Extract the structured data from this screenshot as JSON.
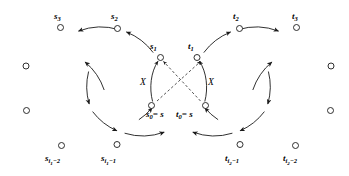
{
  "figure": {
    "name": "two-cycle-crossing-diagram",
    "background": "#ffffff",
    "stroke_color": "#1a1a1a",
    "node_fill": "#ffffff",
    "width": 349,
    "height": 176
  },
  "labels": {
    "s3": "s",
    "s3_sub": "3",
    "s2": "s",
    "s2_sub": "2",
    "s1": "s",
    "s1_sub": "1",
    "s0": "s",
    "s0_sub": "0",
    "s0_eq": "= s",
    "si1m1": "s",
    "si1m1_sub": "i",
    "si1m1_sub2": "1",
    "si1m1_tail": "−1",
    "si1m2": "s",
    "si1m2_sub": "i",
    "si1m2_sub2": "1",
    "si1m2_tail": "−2",
    "t3": "t",
    "t3_sub": "3",
    "t2": "t",
    "t2_sub": "2",
    "t1": "t",
    "t1_sub": "1",
    "t0": "t",
    "t0_sub": "0",
    "t0_eq": "= s",
    "ti2m1": "t",
    "ti2m1_sub": "i",
    "ti2m1_sub2": "2",
    "ti2m1_tail": "−1",
    "ti2m2": "t",
    "ti2m2_sub": "i",
    "ti2m2_sub2": "2",
    "ti2m2_tail": "−2",
    "x_left": "X",
    "x_right": "X"
  },
  "graph_structure": {
    "left_cycle": {
      "name": "s-cycle",
      "direction": "counterclockwise",
      "center": [
        150,
        88
      ],
      "radius": 62,
      "labeled_nodes": [
        "s1",
        "s2",
        "s3",
        "s_{i1-2}",
        "s_{i1-1}",
        "s0"
      ],
      "unlabeled_node_count": 2
    },
    "right_cycle": {
      "name": "t-cycle",
      "direction": "clockwise",
      "center": [
        207,
        88
      ],
      "radius": 62,
      "labeled_nodes": [
        "t1",
        "t2",
        "t3",
        "t_{i2-2}",
        "t_{i2-1}",
        "t0"
      ],
      "unlabeled_node_count": 2
    },
    "dashed_links": [
      {
        "from": "s0",
        "to": "t1"
      },
      {
        "from": "t0",
        "to": "s1"
      }
    ],
    "solid_vertical_links": [
      {
        "from": "s0",
        "to": "s1",
        "label": "X"
      },
      {
        "from": "t0",
        "to": "t1",
        "label": "X"
      }
    ]
  }
}
